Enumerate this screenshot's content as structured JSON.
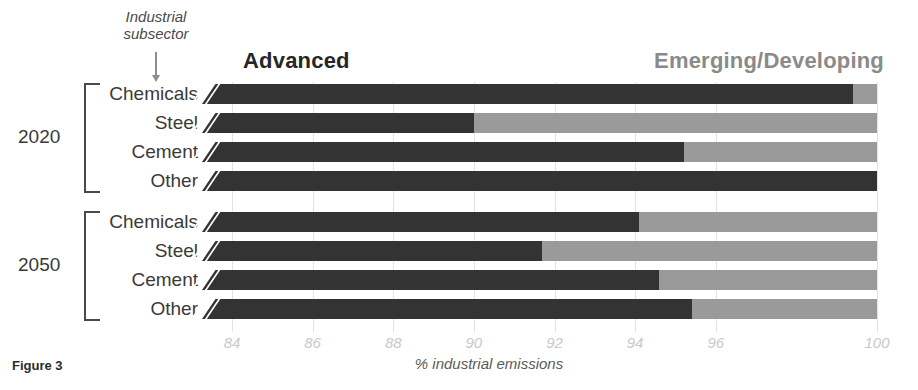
{
  "figure": {
    "caption": "Figure 3"
  },
  "annotation": {
    "subsector_line1": "Industrial",
    "subsector_line2": "subsector",
    "arrow_icon": "down-arrow-icon"
  },
  "legend": {
    "advanced_label": "Advanced",
    "emerging_label": "Emerging/Developing",
    "advanced_color": "#333333",
    "emerging_color": "#9a9a9a",
    "emerging_text_color": "#8a8a8a"
  },
  "groups": [
    {
      "year": "2020",
      "categories": [
        "Chemicals",
        "Steel",
        "Cement",
        "Other"
      ]
    },
    {
      "year": "2050",
      "categories": [
        "Chemicals",
        "Steel",
        "Cement",
        "Other"
      ]
    }
  ],
  "axis": {
    "tick_labels": [
      "84",
      "86",
      "88",
      "90",
      "92",
      "94",
      "96",
      "100"
    ],
    "title": "% industrial emissions"
  },
  "chart_data": {
    "type": "bar",
    "orientation": "horizontal",
    "stacked": true,
    "title": "",
    "xlabel": "% industrial emissions",
    "ylabel": "",
    "xlim": [
      84,
      100
    ],
    "xticks": [
      84,
      86,
      88,
      90,
      92,
      94,
      96,
      100
    ],
    "xtick_labels": [
      "84",
      "86",
      "88",
      "90",
      "92",
      "94",
      "96",
      "100"
    ],
    "x_axis_broken": true,
    "x_axis_break_at": 84,
    "grid": "vertical",
    "legend_position": "top",
    "series": [
      {
        "name": "Advanced",
        "color": "#333333",
        "values": [
          99.4,
          90.0,
          95.2,
          100.0,
          94.1,
          91.7,
          94.6,
          95.4
        ]
      },
      {
        "name": "Emerging/Developing",
        "color": "#9a9a9a",
        "values": [
          0.6,
          10.0,
          4.8,
          0.0,
          5.9,
          8.3,
          5.4,
          4.6
        ]
      }
    ],
    "categories": [
      "2020 Chemicals",
      "2020 Steel",
      "2020 Cement",
      "2020 Other",
      "2050 Chemicals",
      "2050 Steel",
      "2050 Cement",
      "2050 Other"
    ],
    "groups": [
      {
        "year": "2020",
        "bars": [
          {
            "label": "Chemicals",
            "advanced": 99.4,
            "emerging": 0.6
          },
          {
            "label": "Steel",
            "advanced": 90.0,
            "emerging": 10.0
          },
          {
            "label": "Cement",
            "advanced": 95.2,
            "emerging": 4.8
          },
          {
            "label": "Other",
            "advanced": 100.0,
            "emerging": 0.0
          }
        ]
      },
      {
        "year": "2050",
        "bars": [
          {
            "label": "Chemicals",
            "advanced": 94.1,
            "emerging": 5.9
          },
          {
            "label": "Steel",
            "advanced": 91.7,
            "emerging": 8.3
          },
          {
            "label": "Cement",
            "advanced": 94.6,
            "emerging": 5.4
          },
          {
            "label": "Other",
            "advanced": 95.4,
            "emerging": 4.6
          }
        ]
      }
    ]
  }
}
